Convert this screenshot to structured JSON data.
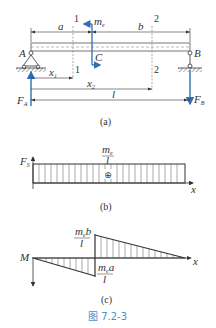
{
  "figure": {
    "caption": "图 7.2-3",
    "caption_color": "#4a90c8",
    "force_color": "#2e6fb5",
    "line_color": "#333333"
  },
  "panel_a": {
    "label": "(a)",
    "support_left": "A",
    "support_right": "B",
    "moment_label": "m",
    "moment_sub": "e",
    "point_label": "C",
    "dim_a": "a",
    "dim_b": "b",
    "dim_x1": "x",
    "dim_x1_sub": "1",
    "dim_x2": "x",
    "dim_x2_sub": "2",
    "dim_l": "l",
    "section1_top": "1",
    "section1_bottom": "1",
    "section2_top": "2",
    "section2_bottom": "2",
    "reaction_left": "F",
    "reaction_left_sub": "A",
    "reaction_right": "F",
    "reaction_right_sub": "B"
  },
  "panel_b": {
    "label": "(b)",
    "y_axis": "F",
    "y_axis_sub": "S",
    "x_axis": "x",
    "value_num": "m",
    "value_num_sub": "e",
    "value_den": "l",
    "sign": "⊕"
  },
  "panel_c": {
    "label": "(c)",
    "y_axis": "M",
    "x_axis": "x",
    "peak_pos_num": "m",
    "peak_pos_num_sub": "e",
    "peak_pos_num_tail": "b",
    "peak_pos_den": "l",
    "peak_neg_num": "m",
    "peak_neg_num_sub": "e",
    "peak_neg_num_tail": "a",
    "peak_neg_den": "l"
  }
}
